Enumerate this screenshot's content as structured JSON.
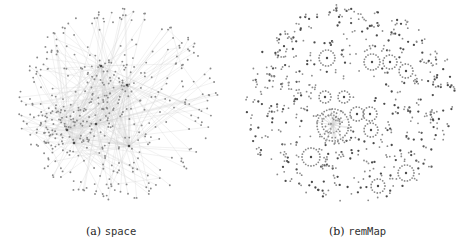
{
  "figure": {
    "panels": [
      {
        "id": "a",
        "label": "(a)",
        "name": "space",
        "graph": {
          "center": [
            64,
            104
          ],
          "radius": [
            97,
            98
          ],
          "nodes": 420,
          "edge_density": "high",
          "hubs": [
            [
              67,
              127
            ],
            [
              101,
              68
            ],
            [
              127,
              85
            ],
            [
              96,
              124
            ],
            [
              129,
              146
            ],
            [
              74,
              143
            ]
          ]
        }
      },
      {
        "id": "b",
        "label": "(b)",
        "name": "remMap",
        "graph": {
          "center": [
            350,
            105
          ],
          "radius": [
            106,
            100
          ],
          "nodes": 1100,
          "edge_density": "low",
          "clusters": [
            [
              327,
              58
            ],
            [
              372,
              62
            ],
            [
              390,
              62
            ],
            [
              405,
              71
            ],
            [
              331,
              124
            ],
            [
              357,
              114
            ],
            [
              370,
              114
            ],
            [
              371,
              130
            ],
            [
              311,
              157
            ],
            [
              378,
              186
            ],
            [
              406,
              173
            ],
            [
              325,
              97
            ],
            [
              344,
              97
            ]
          ]
        }
      }
    ],
    "colors": {
      "node": "#8a8a8a",
      "node_dark": "#4a4a4a",
      "edge": "#cfcfcf"
    }
  }
}
